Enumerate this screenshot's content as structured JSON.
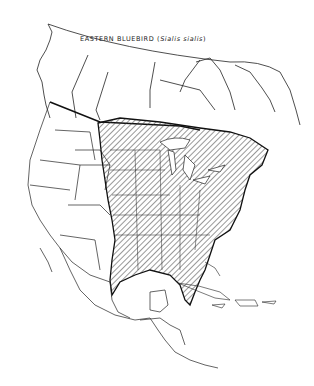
{
  "map": {
    "title": "EASTERN BLUEBIRD",
    "scientific_name_open": "(",
    "scientific_name": "Sialis  sialis",
    "scientific_name_close": ")",
    "region": "North America",
    "legend": {
      "hatched_area": "Range of the Eastern Bluebird"
    },
    "colors": {
      "outline": "#222222",
      "background": "#ffffff",
      "hatch": "#333333"
    }
  }
}
